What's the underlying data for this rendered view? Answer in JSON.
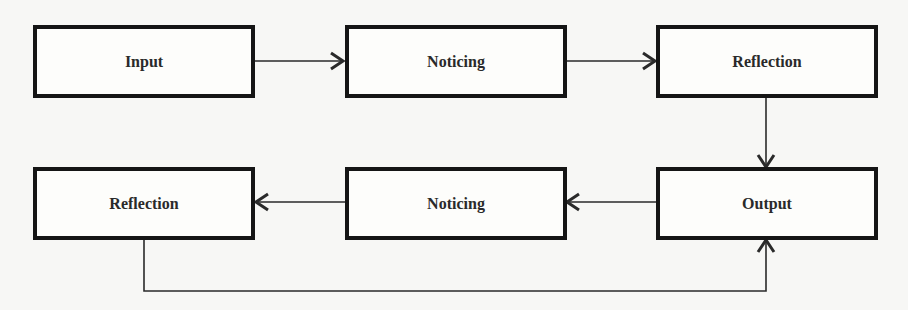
{
  "diagram": {
    "type": "flowchart",
    "colors": {
      "background": "#f7f7f5",
      "box_border": "#151515",
      "line": "#2a2a2a",
      "text": "#2a2a2a"
    },
    "nodes": [
      {
        "id": "input",
        "label": "Input"
      },
      {
        "id": "noticing1",
        "label": "Noticing"
      },
      {
        "id": "reflection1",
        "label": "Reflection"
      },
      {
        "id": "output",
        "label": "Output"
      },
      {
        "id": "noticing2",
        "label": "Noticing"
      },
      {
        "id": "reflection2",
        "label": "Reflection"
      }
    ],
    "edges": [
      {
        "from": "input",
        "to": "noticing1"
      },
      {
        "from": "noticing1",
        "to": "reflection1"
      },
      {
        "from": "reflection1",
        "to": "output"
      },
      {
        "from": "output",
        "to": "noticing2"
      },
      {
        "from": "noticing2",
        "to": "reflection2"
      },
      {
        "from": "reflection2",
        "to": "output"
      }
    ]
  }
}
